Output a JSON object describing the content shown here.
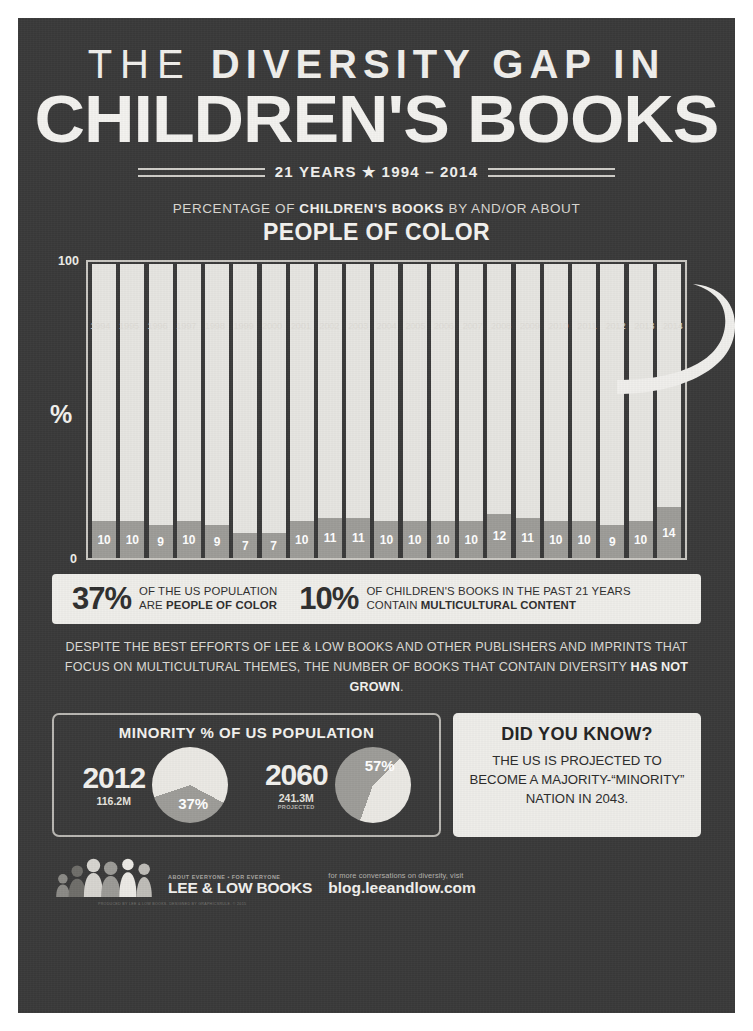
{
  "header": {
    "title_line1_plain": "THE ",
    "title_line1_bold": "DIVERSITY GAP IN",
    "title_line2": "CHILDREN'S BOOKS",
    "years_badge": "21 YEARS ★ 1994 – 2014",
    "subtitle_pre": "PERCENTAGE OF ",
    "subtitle_bold": "CHILDREN'S BOOKS",
    "subtitle_post": " BY AND/OR ABOUT",
    "subtitle_big": "PEOPLE OF COLOR"
  },
  "chart_data": {
    "type": "bar",
    "title": "PERCENTAGE OF CHILDREN'S BOOKS BY AND/OR ABOUT PEOPLE OF COLOR",
    "xlabel": "",
    "ylabel": "%",
    "ylim": [
      0,
      100
    ],
    "ytick_labels": [
      "0",
      "100"
    ],
    "grid": false,
    "categories": [
      "1994",
      "1995",
      "1996",
      "1997",
      "1998",
      "1999",
      "2000",
      "2001",
      "2002",
      "2003",
      "2004",
      "2005",
      "2006",
      "2007",
      "2008",
      "2009",
      "2010",
      "2011",
      "2012",
      "2013",
      "2014"
    ],
    "values": [
      10,
      10,
      9,
      10,
      9,
      7,
      7,
      10,
      11,
      11,
      10,
      10,
      10,
      10,
      12,
      11,
      10,
      10,
      9,
      10,
      14
    ],
    "series": [
      {
        "name": "Books by and/or about people of color (%)",
        "values": [
          10,
          10,
          9,
          10,
          9,
          7,
          7,
          10,
          11,
          11,
          10,
          10,
          10,
          10,
          12,
          11,
          10,
          10,
          9,
          10,
          14
        ]
      }
    ],
    "colors": {
      "value_segment": "#9d9c98",
      "remainder": "#e6e5e1"
    }
  },
  "banner": {
    "stats": [
      {
        "pct": "37%",
        "line1_pre": "OF THE US POPULATION",
        "line2_pre": "ARE ",
        "line2_bold": "PEOPLE OF COLOR"
      },
      {
        "pct": "10%",
        "line1_pre": "OF CHILDREN'S BOOKS IN THE PAST 21 YEARS",
        "line2_pre": "CONTAIN ",
        "line2_bold": "MULTICULTURAL CONTENT"
      }
    ]
  },
  "paragraph": {
    "text_pre": "DESPITE THE BEST EFFORTS OF LEE & LOW BOOKS AND OTHER PUBLISHERS AND IMPRINTS THAT FOCUS ON MULTICULTURAL THEMES, THE NUMBER OF BOOKS THAT CONTAIN DIVERSITY ",
    "text_bold": "HAS NOT GROWN",
    "text_post": "."
  },
  "pies_panel": {
    "heading": "MINORITY % OF US POPULATION",
    "items": [
      {
        "year": "2012",
        "population": "116.2M",
        "note": "",
        "pct_label": "37%",
        "pct_value": 37
      },
      {
        "year": "2060",
        "population": "241.3M",
        "note": "PROJECTED",
        "pct_label": "57%",
        "pct_value": 57
      }
    ]
  },
  "did_you_know": {
    "heading": "DID YOU KNOW?",
    "body": "THE US IS PROJECTED TO BECOME A MAJORITY-“MINORITY” NATION IN 2043."
  },
  "footer": {
    "tagline": "ABOUT EVERYONE • FOR EVERYONE",
    "brand_name": "LEE & LOW BOOKS",
    "conversation_text": "for more conversations on diversity, visit",
    "url": "blog.leeandlow.com",
    "credit": "PRODUCED BY LEE & LOW BOOKS. DESIGNED BY GRAPHICSRULE. © 2015"
  }
}
